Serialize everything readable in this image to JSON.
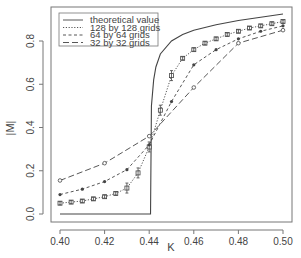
{
  "chart_data": {
    "type": "line",
    "title": "",
    "xlabel": "K",
    "ylabel": "|M|",
    "xlim": [
      0.4,
      0.5
    ],
    "ylim": [
      -0.02,
      0.93
    ],
    "x_ticks": [
      "0.40",
      "0.42",
      "0.44",
      "0.46",
      "0.48",
      "0.50"
    ],
    "y_ticks": [
      "0.0",
      "0.2",
      "0.4",
      "0.6",
      "0.8"
    ],
    "grid": false,
    "legend_position": "top-left",
    "legend": [
      "theoretical value",
      "128 by 128 grids",
      "64 by 64 grids",
      "32 by 32 grids"
    ],
    "series": [
      {
        "name": "theoretical value",
        "style": "solid",
        "x": [
          0.4,
          0.4406,
          0.441,
          0.442,
          0.443,
          0.445,
          0.45,
          0.455,
          0.46,
          0.47,
          0.48,
          0.49,
          0.5
        ],
        "values": [
          0.0,
          0.0,
          0.5,
          0.62,
          0.68,
          0.74,
          0.8,
          0.83,
          0.85,
          0.875,
          0.895,
          0.91,
          0.925
        ]
      },
      {
        "name": "128 by 128 grids",
        "style": "dotted",
        "marker": "square-with-errorbar",
        "x": [
          0.4,
          0.405,
          0.41,
          0.415,
          0.42,
          0.425,
          0.43,
          0.435,
          0.44,
          0.445,
          0.45,
          0.455,
          0.46,
          0.465,
          0.47,
          0.475,
          0.48,
          0.485,
          0.49,
          0.495,
          0.5
        ],
        "values": [
          0.05,
          0.055,
          0.06,
          0.07,
          0.08,
          0.095,
          0.12,
          0.19,
          0.31,
          0.48,
          0.64,
          0.72,
          0.76,
          0.79,
          0.81,
          0.83,
          0.845,
          0.86,
          0.87,
          0.88,
          0.89
        ]
      },
      {
        "name": "64 by 64 grids",
        "style": "dashed-short",
        "marker": "filled-dot",
        "x": [
          0.4,
          0.41,
          0.42,
          0.43,
          0.44,
          0.45,
          0.46,
          0.47,
          0.48,
          0.49,
          0.5
        ],
        "values": [
          0.09,
          0.115,
          0.15,
          0.205,
          0.32,
          0.52,
          0.69,
          0.76,
          0.81,
          0.845,
          0.87
        ]
      },
      {
        "name": "32 by 32 grids",
        "style": "dashed-long",
        "marker": "open-circle",
        "x": [
          0.4,
          0.42,
          0.44,
          0.46,
          0.48,
          0.5
        ],
        "values": [
          0.155,
          0.235,
          0.36,
          0.585,
          0.79,
          0.85
        ]
      }
    ]
  },
  "colors": {
    "line": "#444444",
    "frame": "#666666",
    "background": "#ffffff"
  }
}
